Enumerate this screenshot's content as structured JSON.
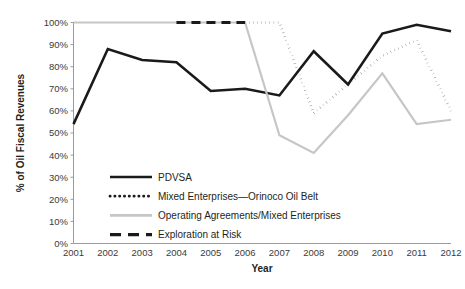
{
  "chart_data": {
    "type": "line",
    "title": "",
    "xlabel": "Year",
    "ylabel": "% of Oil Fiscal Revenues",
    "x": [
      2001,
      2002,
      2003,
      2004,
      2005,
      2006,
      2007,
      2008,
      2009,
      2010,
      2011,
      2012
    ],
    "categories": [
      "2001",
      "2002",
      "2003",
      "2004",
      "2005",
      "2006",
      "2007",
      "2008",
      "2009",
      "2010",
      "2011",
      "2012"
    ],
    "xlim": [
      2001,
      2012
    ],
    "ylim": [
      0,
      100
    ],
    "ytick_labels": [
      "100%",
      "90%",
      "80%",
      "70%",
      "60%",
      "50%",
      "40%",
      "30%",
      "20%",
      "10%",
      "0%"
    ],
    "ytick_values": [
      100,
      90,
      80,
      70,
      60,
      50,
      40,
      30,
      20,
      10,
      0
    ],
    "grid": false,
    "legend_position": "inside-lower-left",
    "series": [
      {
        "name": "PDVSA",
        "style": "solid",
        "color": "#1a1a1a",
        "width": 2.6,
        "x": [
          2001,
          2002,
          2003,
          2004,
          2005,
          2006,
          2007,
          2008,
          2009,
          2010,
          2011,
          2012
        ],
        "values": [
          54,
          88,
          83,
          82,
          69,
          70,
          67,
          87,
          72,
          95,
          99,
          96
        ]
      },
      {
        "name": "Mixed Enterprises—Orinoco Oil Belt",
        "style": "dotted",
        "color": "#1a1a1a",
        "width": 2.6,
        "x": [
          2006,
          2007,
          2008,
          2009,
          2010,
          2011,
          2012
        ],
        "values": [
          100,
          100,
          59,
          72,
          85,
          92,
          60
        ]
      },
      {
        "name": "Operating Agreements/Mixed Enterprises",
        "style": "solid",
        "color": "#c6c6c6",
        "width": 2.2,
        "x": [
          2001,
          2002,
          2003,
          2004,
          2005,
          2006,
          2007,
          2008,
          2009,
          2010,
          2011,
          2012
        ],
        "values": [
          100,
          100,
          100,
          100,
          100,
          100,
          49,
          41,
          58,
          77,
          54,
          56
        ]
      },
      {
        "name": "Exploration at Risk",
        "style": "dashed",
        "color": "#1a1a1a",
        "width": 3.0,
        "x": [
          2004,
          2005,
          2006
        ],
        "values": [
          100,
          100,
          100
        ]
      }
    ],
    "legend": [
      {
        "label": "PDVSA",
        "style": "solid",
        "color": "#1a1a1a"
      },
      {
        "label": "Mixed Enterprises—Orinoco Oil Belt",
        "style": "dotted",
        "color": "#1a1a1a"
      },
      {
        "label": "Operating Agreements/Mixed Enterprises",
        "style": "solid",
        "color": "#c6c6c6"
      },
      {
        "label": "Exploration at Risk",
        "style": "dashed",
        "color": "#1a1a1a"
      }
    ]
  },
  "colors": {
    "background": "#ffffff",
    "axis": "#9a9a9a",
    "text": "#231f20",
    "tick_text": "#3b3b3b",
    "dark_series": "#1a1a1a",
    "light_series": "#c6c6c6"
  }
}
